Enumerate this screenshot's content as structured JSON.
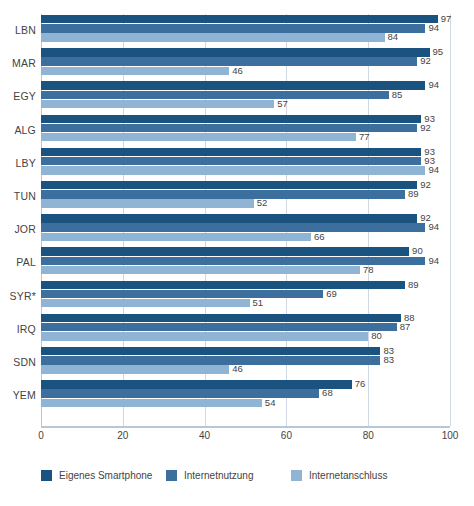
{
  "chart_data": {
    "type": "bar",
    "orientation": "horizontal",
    "grouped": true,
    "title": "",
    "xlabel": "",
    "ylabel": "",
    "xlim": [
      0,
      100
    ],
    "xticks": [
      "0",
      "20",
      "40",
      "60",
      "80",
      "100"
    ],
    "grid": true,
    "legend_position": "bottom",
    "categories": [
      "LBN",
      "MAR",
      "EGY",
      "ALG",
      "LBY",
      "TUN",
      "JOR",
      "PAL",
      "SYR*",
      "IRQ",
      "SDN",
      "YEM"
    ],
    "series": [
      {
        "name": "Eigenes Smartphone",
        "color": "#1b5380",
        "values": [
          97,
          95,
          94,
          93,
          93,
          92,
          92,
          90,
          89,
          88,
          83,
          76
        ]
      },
      {
        "name": "Internetnutzung",
        "color": "#3d6f9e",
        "values": [
          94,
          92,
          85,
          92,
          93,
          89,
          94,
          94,
          69,
          87,
          83,
          68
        ]
      },
      {
        "name": "Internetanschluss",
        "color": "#8fb4d4",
        "values": [
          84,
          46,
          57,
          77,
          94,
          52,
          66,
          78,
          51,
          80,
          46,
          54
        ]
      }
    ]
  },
  "colors": {
    "series_dark": "#1b5380",
    "series_medium": "#3d6f9e",
    "series_light": "#8fb4d4",
    "grid": "#cfd9e3",
    "text": "#46433f"
  }
}
